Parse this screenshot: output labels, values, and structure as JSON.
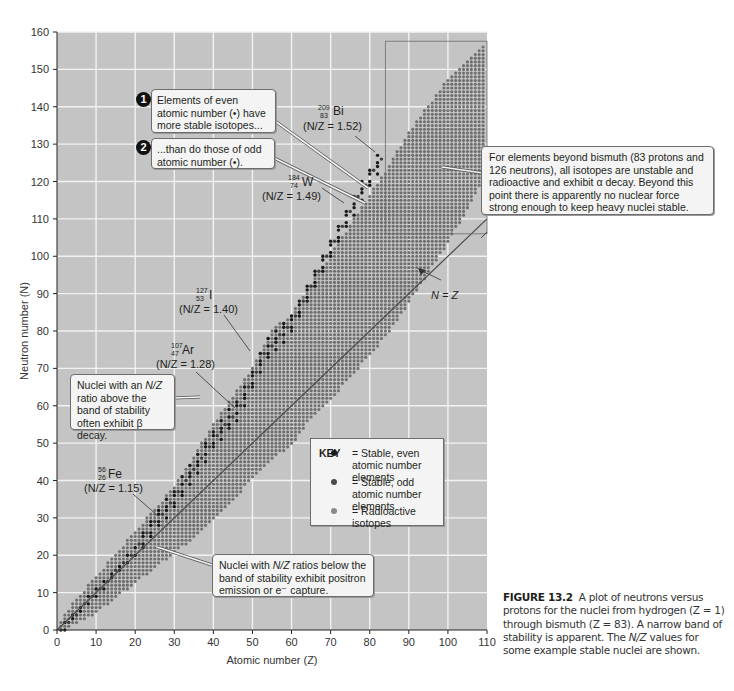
{
  "figure": {
    "caption_label": "FIGURE 13.2",
    "caption_text_1": "A plot of neutrons versus protons for the nuclei from hydrogen (Z = 1) through bismuth (Z = 83). A narrow band of stability is apparent. The",
    "caption_text_italic": "N/Z",
    "caption_text_2": "values for some example stable nuclei are shown."
  },
  "callouts": {
    "even_badge": "1",
    "even_text": "Elements of even atomic number (•) have more stable isotopes...",
    "odd_badge": "2",
    "odd_text": "...than do those of odd atomic number (•).",
    "beyond_bismuth": "For elements beyond bismuth (83 protons and 126 neutrons), all isotopes are unstable and radioactive and exhibit α decay.  Beyond this point there is apparently no nuclear force strong enough to keep heavy nuclei stable.",
    "beta_decay_1": "Nuclei with an ",
    "beta_decay_italic": "N/Z",
    "beta_decay_2": " ratio above the band of stability often exhibit β decay.",
    "positron_1": "Nuclei with ",
    "positron_italic": "N/Z",
    "positron_2": " ratios below the band of stability exhibit positron emission or e⁻ capture.",
    "nz_line_label": "N = Z"
  },
  "isotopes": [
    {
      "mass": "209",
      "atomic": "83",
      "symbol": "Bi",
      "ratio": "(N/Z = 1.52)",
      "z": 83,
      "n": 126
    },
    {
      "mass": "184",
      "atomic": "74",
      "symbol": "W",
      "ratio": "(N/Z = 1.49)",
      "z": 74,
      "n": 110
    },
    {
      "mass": "127",
      "atomic": "53",
      "symbol": "I",
      "ratio": "(N/Z = 1.40)",
      "z": 53,
      "n": 74
    },
    {
      "mass": "107",
      "atomic": "47",
      "symbol": "Ar",
      "ratio": "(N/Z = 1.28)",
      "z": 47,
      "n": 60
    },
    {
      "mass": "56",
      "atomic": "26",
      "symbol": "Fe",
      "ratio": "(N/Z = 1.15)",
      "z": 26,
      "n": 30
    }
  ],
  "key": {
    "title": "KEY",
    "items": [
      {
        "label": "= Stable, even atomic number elements",
        "color": "#1a1a1a"
      },
      {
        "label": "= Stable, odd atomic number elements",
        "color": "#4a4a4a"
      },
      {
        "label": "= Radioactive isotopes",
        "color": "#7d7d7d"
      }
    ]
  },
  "colors": {
    "plot_bg": "#c4c4c4",
    "grid": "#f2f2f2",
    "band": "#6e6e6e",
    "stable_even": "#1a1a1a",
    "stable_odd": "#3d3d3d",
    "nz_line": "#4a4a4a"
  },
  "chart_data": {
    "type": "scatter",
    "title": "",
    "xlabel": "Atomic number (Z)",
    "ylabel": "Neutron number (N)",
    "xlim": [
      0,
      110
    ],
    "ylim": [
      0,
      160
    ],
    "xticks": [
      0,
      10,
      20,
      30,
      40,
      50,
      60,
      70,
      80,
      90,
      100,
      110
    ],
    "yticks": [
      0,
      10,
      20,
      30,
      40,
      50,
      60,
      70,
      80,
      90,
      100,
      110,
      120,
      130,
      140,
      150,
      160
    ],
    "grid": true,
    "legend_position": "lower right (inside plot)",
    "reference_line": {
      "label": "N = Z",
      "x": [
        0,
        110
      ],
      "y": [
        0,
        110
      ]
    },
    "highlight_region": {
      "x": [
        84,
        110
      ],
      "y": [
        106,
        157
      ],
      "note": "elements beyond bismuth"
    },
    "band_of_isotopes": {
      "description": "radioactive isotopes band (min/max N for each Z)",
      "z": [
        1,
        5,
        10,
        15,
        20,
        25,
        30,
        35,
        40,
        45,
        50,
        55,
        60,
        65,
        70,
        75,
        80,
        85,
        90,
        95,
        100,
        105,
        109
      ],
      "n_min": [
        0,
        2,
        5,
        9,
        13,
        17,
        21,
        25,
        30,
        35,
        41,
        46,
        50,
        57,
        62,
        68,
        74,
        80,
        88,
        96,
        104,
        113,
        121
      ],
      "n_max": [
        2,
        8,
        14,
        20,
        26,
        32,
        38,
        46,
        55,
        62,
        70,
        80,
        84,
        92,
        100,
        108,
        116,
        124,
        133,
        140,
        147,
        152,
        156
      ]
    },
    "stable_band": {
      "description": "stable nuclei (even/odd Z) centered line",
      "z": [
        1,
        10,
        20,
        26,
        30,
        40,
        47,
        53,
        60,
        70,
        74,
        80,
        83
      ],
      "n_center": [
        0,
        10,
        21,
        30,
        35,
        51,
        60,
        74,
        82,
        102,
        110,
        121,
        126
      ]
    },
    "annotated_points": [
      {
        "label": "209/83 Bi",
        "z": 83,
        "n": 126,
        "nz": 1.52
      },
      {
        "label": "184/74 W",
        "z": 74,
        "n": 110,
        "nz": 1.49
      },
      {
        "label": "127/53 I",
        "z": 53,
        "n": 74,
        "nz": 1.4
      },
      {
        "label": "107/47 Ar",
        "z": 47,
        "n": 60,
        "nz": 1.28
      },
      {
        "label": "56/26 Fe",
        "z": 26,
        "n": 30,
        "nz": 1.15
      }
    ]
  }
}
